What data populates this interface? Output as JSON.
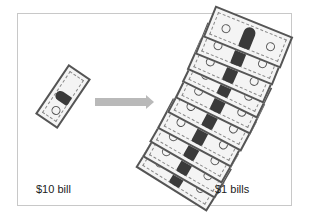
{
  "diagram": {
    "left_item": {
      "label": "$10 bill",
      "count": 1,
      "denomination": 10
    },
    "right_item": {
      "label": "$1 bills",
      "count": 10,
      "denomination": 1
    },
    "arrow": {
      "direction": "right",
      "color": "#b9b9b9"
    },
    "border_color": "#c8c8c8"
  }
}
